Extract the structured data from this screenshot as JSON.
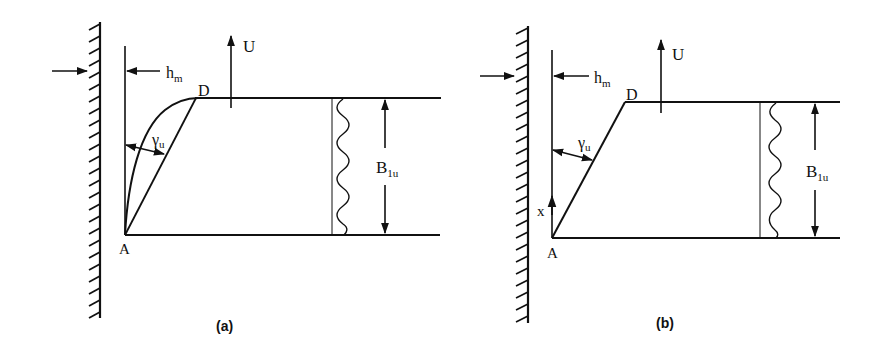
{
  "figure": {
    "panels": [
      {
        "id": "a",
        "caption": "(a)",
        "labels": {
          "hm_main": "h",
          "hm_sub": "m",
          "U": "U",
          "D": "D",
          "A": "A",
          "gamma_main": "γ",
          "gamma_sub": "u",
          "B_main": "B",
          "B_sub": "1u"
        },
        "description": "Curved failure surface from A to D with wall on left, uplift U"
      },
      {
        "id": "b",
        "caption": "(b)",
        "labels": {
          "hm_main": "h",
          "hm_sub": "m",
          "U": "U",
          "D": "D",
          "A": "A",
          "x": "x",
          "gamma_main": "γ",
          "gamma_sub": "u",
          "B_main": "B",
          "B_sub": "1u"
        },
        "description": "Straight failure line from A to D with wall on left, uplift U"
      }
    ],
    "colors": {
      "ink": "#111111",
      "background": "#ffffff"
    }
  }
}
